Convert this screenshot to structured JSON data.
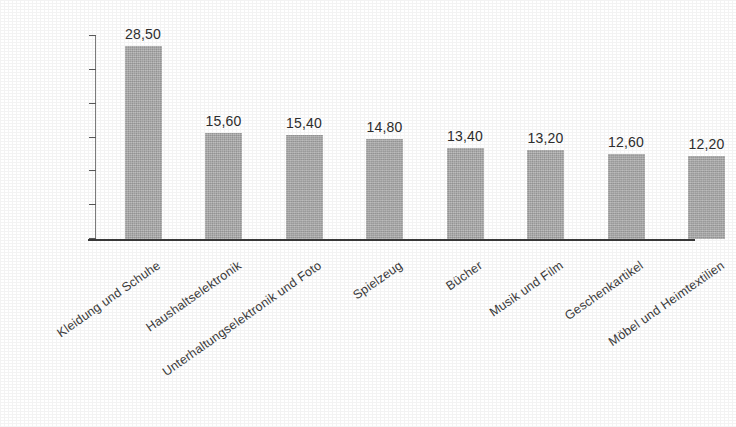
{
  "chart_data": {
    "type": "bar",
    "title": "",
    "subtitle": "",
    "xlabel": "",
    "ylabel": "",
    "ylim": [
      0,
      30
    ],
    "ytick_labels": [
      "30",
      "25",
      "20",
      "15",
      "10",
      "5",
      "0"
    ],
    "ytick_values": [
      30,
      25,
      20,
      15,
      10,
      5,
      0
    ],
    "grid": false,
    "legend": false,
    "orientation": "vertical",
    "bar_color": "#a9a9a9",
    "axis_color": "#3a3a3a",
    "categories": [
      "Kleidung und Schuhe",
      "Haushaltselektronik",
      "Unterhaltungselektronik und Foto",
      "Spielzeug",
      "Bücher",
      "Musik und Film",
      "Geschenkartikel",
      "Möbel und Heimtextilien"
    ],
    "values": [
      28.5,
      15.6,
      15.4,
      14.8,
      13.4,
      13.2,
      12.6,
      12.2
    ],
    "value_labels": [
      "28,50",
      "15,60",
      "15,40",
      "14,80",
      "13,40",
      "13,20",
      "12,60",
      "12,20"
    ]
  }
}
